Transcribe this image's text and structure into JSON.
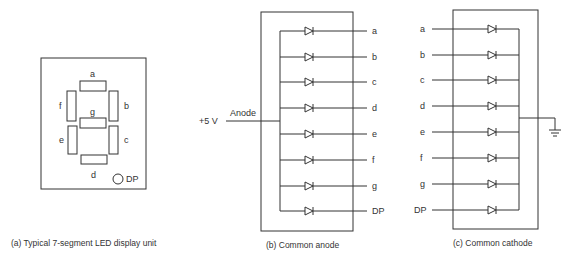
{
  "panel_a": {
    "caption": "(a)  Typical 7-segment LED display unit",
    "segments": [
      {
        "id": "a",
        "label": "a"
      },
      {
        "id": "b",
        "label": "b"
      },
      {
        "id": "c",
        "label": "c"
      },
      {
        "id": "d",
        "label": "d"
      },
      {
        "id": "e",
        "label": "e"
      },
      {
        "id": "f",
        "label": "f"
      },
      {
        "id": "g",
        "label": "g"
      }
    ],
    "dp_label": "DP"
  },
  "panel_b": {
    "caption": "(b)  Common anode",
    "supply_label": "+5 V",
    "anode_label": "Anode",
    "outputs": [
      "a",
      "b",
      "c",
      "d",
      "e",
      "f",
      "g",
      "DP"
    ]
  },
  "panel_c": {
    "caption": "(c)  Common cathode",
    "inputs": [
      "a",
      "b",
      "c",
      "d",
      "e",
      "f",
      "g",
      "DP"
    ],
    "ground_symbol": "ground-icon"
  }
}
